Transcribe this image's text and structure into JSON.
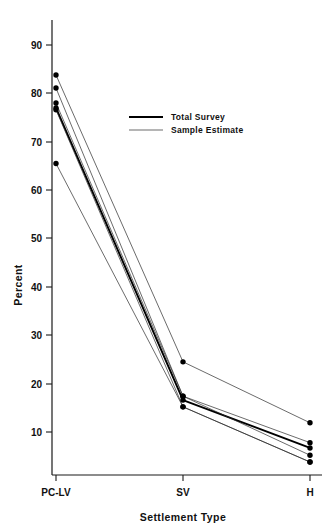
{
  "chart_data": {
    "type": "line",
    "title": "",
    "xlabel": "Settlement Type",
    "ylabel": "Percent",
    "categories": [
      "PC-LV",
      "SV",
      "H"
    ],
    "x_positions": [
      0,
      1,
      2
    ],
    "ylim": [
      1,
      96
    ],
    "yticks": [
      10,
      20,
      30,
      40,
      50,
      60,
      70,
      80,
      90
    ],
    "ytick_labels": [
      "10",
      "20",
      "30",
      "40",
      "50",
      "60",
      "70",
      "80",
      "90"
    ],
    "grid": false,
    "legend_position": "upper-center",
    "legend": [
      {
        "name": "Total Survey",
        "style": "thick"
      },
      {
        "name": "Sample Estimate",
        "style": "thin"
      }
    ],
    "series": [
      {
        "name": "Total Survey",
        "style": "thick",
        "values": [
          77.0,
          16.6,
          6.7
        ]
      },
      {
        "name": "Sample Estimate",
        "style": "thin",
        "values": [
          83.8,
          24.5,
          11.9
        ]
      },
      {
        "name": "Sample Estimate",
        "style": "thin",
        "values": [
          81.1,
          17.4,
          7.8
        ]
      },
      {
        "name": "Sample Estimate",
        "style": "thin",
        "values": [
          78.0,
          17.4,
          5.2
        ]
      },
      {
        "name": "Sample Estimate",
        "style": "thin",
        "values": [
          76.6,
          15.2,
          3.8
        ]
      },
      {
        "name": "Sample Estimate",
        "style": "thin",
        "values": [
          65.5,
          15.2,
          3.8
        ]
      }
    ]
  },
  "axes": {
    "y_title": "Percent",
    "x_title": "Settlement Type"
  }
}
